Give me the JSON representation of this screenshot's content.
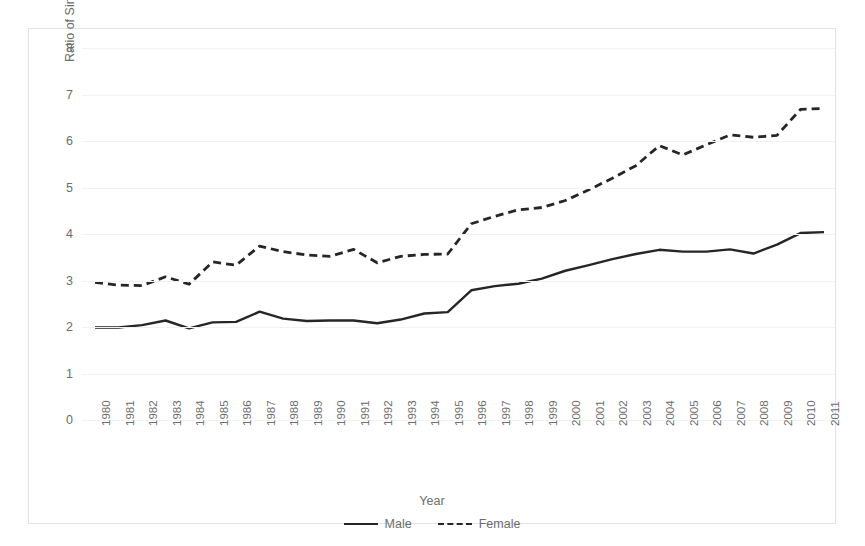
{
  "chart_data": {
    "type": "line",
    "title": "",
    "xlabel": "Year",
    "ylabel": "Ratio of Simple/Aggravated Assault\nArrest Rates",
    "categories": [
      "1980",
      "1981",
      "1982",
      "1983",
      "1984",
      "1985",
      "1986",
      "1987",
      "1988",
      "1989",
      "1990",
      "1991",
      "1992",
      "1993",
      "1994",
      "1995",
      "1996",
      "1997",
      "1998",
      "1999",
      "2000",
      "2001",
      "2002",
      "2003",
      "2004",
      "2005",
      "2006",
      "2007",
      "2008",
      "2009",
      "2010",
      "2011"
    ],
    "x": [
      1980,
      1981,
      1982,
      1983,
      1984,
      1985,
      1986,
      1987,
      1988,
      1989,
      1990,
      1991,
      1992,
      1993,
      1994,
      1995,
      1996,
      1997,
      1998,
      1999,
      2000,
      2001,
      2002,
      2003,
      2004,
      2005,
      2006,
      2007,
      2008,
      2009,
      2010,
      2011
    ],
    "series": [
      {
        "name": "Male",
        "style": "solid",
        "color": "#262626",
        "values": [
          1.99,
          1.99,
          2.04,
          2.14,
          1.97,
          2.1,
          2.11,
          2.33,
          2.18,
          2.13,
          2.14,
          2.14,
          2.08,
          2.16,
          2.29,
          2.32,
          2.79,
          2.88,
          2.93,
          3.04,
          3.21,
          3.33,
          3.46,
          3.57,
          3.66,
          3.62,
          3.62,
          3.67,
          3.58,
          3.77,
          4.02,
          4.04
        ]
      },
      {
        "name": "Female",
        "style": "dashed",
        "color": "#262626",
        "values": [
          2.96,
          2.9,
          2.89,
          3.08,
          2.92,
          3.4,
          3.33,
          3.74,
          3.62,
          3.55,
          3.52,
          3.67,
          3.38,
          3.52,
          3.56,
          3.57,
          4.22,
          4.38,
          4.52,
          4.57,
          4.72,
          4.95,
          5.2,
          5.47,
          5.9,
          5.7,
          5.92,
          6.13,
          6.08,
          6.12,
          6.68,
          6.7
        ]
      }
    ],
    "ylim": [
      0,
      8
    ],
    "yticks": [
      0,
      1,
      2,
      3,
      4,
      5,
      6,
      7,
      8
    ],
    "ytick_labels": [
      "0",
      "1",
      "2",
      "3",
      "4",
      "5",
      "6",
      "7",
      "8"
    ],
    "grid": "horizontal",
    "legend_position": "bottom-center",
    "legend": [
      {
        "label": "Male",
        "style": "solid"
      },
      {
        "label": "Female",
        "style": "dashed"
      }
    ]
  },
  "axis": {
    "x_title": "Year",
    "y_title_line1": "Ratio of Simple/Aggravated Assault",
    "y_title_line2": "Arrest Rates"
  },
  "colors": {
    "line": "#262626",
    "grid": "#f2f2f2",
    "text": "#6d6d6d",
    "frame": "#e3e3e3",
    "background": "#ffffff"
  }
}
